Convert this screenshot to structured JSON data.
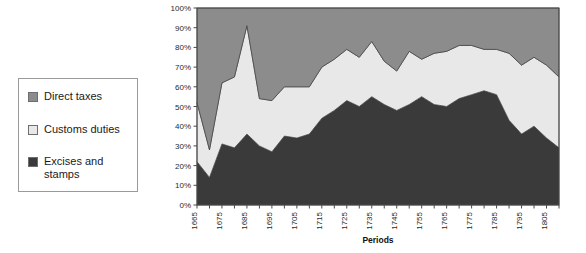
{
  "legend": {
    "items": [
      {
        "label": "Direct taxes",
        "color": "#8c8c8c"
      },
      {
        "label": "Customs duties",
        "color": "#e8e8e8"
      },
      {
        "label": "Excises and\nstamps",
        "color": "#3a3a3a"
      }
    ]
  },
  "chart_data": {
    "type": "area",
    "stacked": true,
    "normalized": true,
    "title": "",
    "xlabel": "Periods",
    "ylabel": "",
    "ylim": [
      0,
      100
    ],
    "ytick_labels": [
      "0%",
      "10%",
      "20%",
      "30%",
      "40%",
      "50%",
      "60%",
      "70%",
      "80%",
      "90%",
      "100%"
    ],
    "ytick_values": [
      0,
      10,
      20,
      30,
      40,
      50,
      60,
      70,
      80,
      90,
      100
    ],
    "grid": false,
    "legend_position": "left-outside",
    "x": [
      1665,
      1670,
      1675,
      1680,
      1685,
      1690,
      1695,
      1700,
      1705,
      1710,
      1715,
      1720,
      1725,
      1730,
      1735,
      1740,
      1745,
      1750,
      1755,
      1760,
      1765,
      1770,
      1775,
      1780,
      1785,
      1790,
      1795,
      1800,
      1805,
      1810
    ],
    "xtick_labels": [
      "1665",
      "1675",
      "1685",
      "1695",
      "1705",
      "1715",
      "1725",
      "1735",
      "1745",
      "1755",
      "1765",
      "1775",
      "1785",
      "1795",
      "1805"
    ],
    "xtick_label_values": [
      1665,
      1675,
      1685,
      1695,
      1705,
      1715,
      1725,
      1735,
      1745,
      1755,
      1765,
      1775,
      1785,
      1795,
      1805
    ],
    "series": [
      {
        "name": "Excises and stamps",
        "color": "#3a3a3a",
        "values": [
          22,
          14,
          31,
          29,
          36,
          30,
          27,
          35,
          34,
          36,
          44,
          48,
          53,
          50,
          55,
          51,
          48,
          51,
          55,
          51,
          50,
          54,
          56,
          58,
          56,
          43,
          36,
          40,
          34,
          29
        ]
      },
      {
        "name": "Customs duties",
        "color": "#e8e8e8",
        "values": [
          30,
          14,
          31,
          36,
          55,
          24,
          26,
          25,
          26,
          24,
          26,
          26,
          26,
          25,
          28,
          22,
          20,
          27,
          19,
          26,
          28,
          27,
          25,
          21,
          23,
          34,
          35,
          35,
          37,
          36
        ]
      },
      {
        "name": "Direct taxes",
        "color": "#8c8c8c",
        "values": [
          48,
          72,
          38,
          35,
          9,
          46,
          47,
          40,
          40,
          40,
          30,
          26,
          21,
          25,
          17,
          27,
          32,
          22,
          26,
          23,
          22,
          19,
          19,
          21,
          21,
          23,
          29,
          25,
          29,
          35
        ]
      }
    ]
  }
}
